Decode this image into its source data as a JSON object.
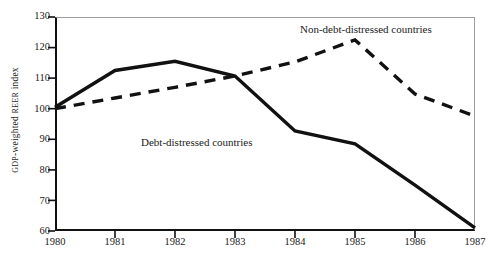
{
  "chart_data": {
    "type": "line",
    "title": "",
    "xlabel": "",
    "ylabel": "GDP-weighted REER index",
    "ylabel_parts": {
      "prefix_caps": "GDP",
      "middle": "-weighted ",
      "mid_caps": "REER",
      "suffix": " index"
    },
    "x": [
      "1980",
      "1981",
      "1982",
      "1983",
      "1984",
      "1985",
      "1986",
      "1987"
    ],
    "xlim": [
      1980,
      1987
    ],
    "ylim": [
      60,
      130
    ],
    "yticks": [
      60,
      70,
      80,
      90,
      100,
      110,
      120,
      130
    ],
    "ytick_labels": [
      "60",
      "70",
      "80",
      "90",
      "100",
      "110",
      "120",
      "130"
    ],
    "xtick_labels": [
      "1980",
      "1981",
      "1982",
      "1983",
      "1984",
      "1985",
      "1986",
      "1987"
    ],
    "grid": false,
    "legend_position": "inline-annotations",
    "series": [
      {
        "name": "Debt-distressed countries",
        "style": "solid",
        "color": "#111111",
        "values": [
          100.5,
          112.5,
          115.5,
          110.7,
          92.7,
          88.5,
          75.0,
          61.0
        ]
      },
      {
        "name": "Non-debt-distressed countries",
        "style": "dashed",
        "color": "#111111",
        "values": [
          100.0,
          103.5,
          107.0,
          110.7,
          115.3,
          122.5,
          104.8,
          97.6
        ]
      }
    ],
    "annotations": [
      {
        "text": "Non-debt-distressed countries",
        "series": "Non-debt-distressed countries"
      },
      {
        "text": "Debt-distressed countries",
        "series": "Debt-distressed countries"
      }
    ]
  },
  "colors": {
    "line": "#111111",
    "axis": "#111111",
    "frame": "#9c9c9c",
    "background": "#ffffff",
    "text": "#1a1a1a"
  }
}
